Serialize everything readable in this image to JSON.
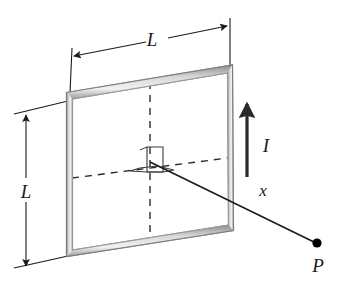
{
  "figure": {
    "background_color": "#ffffff",
    "width": 342,
    "height": 282
  },
  "colors": {
    "line": "#1a1a1a",
    "wire_outer": "#6e6e6e",
    "wire_inner": "#c9c9c9",
    "wire_highlight": "#efefef",
    "dashed": "#2b2b2b",
    "point": "#000000",
    "background": "#ffffff"
  },
  "labels": {
    "width_dimension": "L",
    "height_dimension": "L",
    "current": "I",
    "distance": "x",
    "point": "P"
  },
  "icons": {
    "current_arrow": "up-arrow-icon",
    "width_dimension_arrows": "double-headed-arrow-icon",
    "height_dimension_arrows": "double-headed-arrow-icon",
    "field_point": "filled-dot-icon",
    "right_angle": "right-angle-marker-icon"
  },
  "geometry": {
    "loop_corners": {
      "top_left": [
        69,
        95
      ],
      "top_right": [
        230,
        68
      ],
      "bottom_right": [
        231,
        228
      ],
      "bottom_left": [
        69,
        254
      ]
    },
    "wire_thickness": 5,
    "center": [
      150,
      161
    ],
    "point_P": [
      317,
      243
    ],
    "current_arrow": {
      "from": [
        247,
        175
      ],
      "to": [
        247,
        100
      ]
    },
    "axis_line": {
      "from": [
        150,
        161
      ],
      "to": [
        317,
        243
      ]
    },
    "dashed_vertical": {
      "from": [
        150,
        82
      ],
      "to": [
        150,
        242
      ]
    },
    "dashed_horizontal": {
      "from": [
        72,
        178
      ],
      "to": [
        228,
        158
      ]
    },
    "width_dimension_line": {
      "from": [
        72,
        57
      ],
      "to": [
        229,
        26
      ]
    },
    "height_dimension_line": {
      "from": [
        26,
        118
      ],
      "to": [
        26,
        265
      ]
    }
  }
}
